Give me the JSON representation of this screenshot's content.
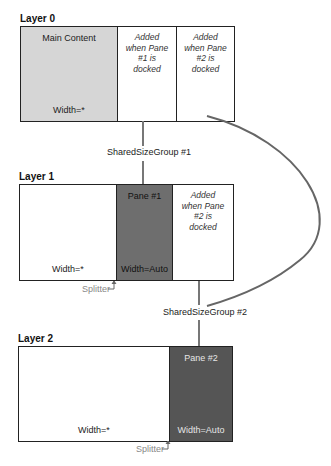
{
  "layers": [
    {
      "title": "Layer 0",
      "columns": [
        {
          "top": "Main Content",
          "bottom": "Width=*",
          "style": "gray"
        },
        {
          "top": "Added when Pane #1 is docked",
          "bottom": "",
          "style": "white-italic"
        },
        {
          "top": "Added when Pane #2 is docked",
          "bottom": "",
          "style": "white-italic"
        }
      ]
    },
    {
      "title": "Layer 1",
      "columns": [
        {
          "top": "",
          "bottom": "Width=*",
          "style": "white"
        },
        {
          "top": "Pane #1",
          "bottom": "Width=Auto",
          "style": "dark"
        },
        {
          "top": "Added when Pane #2 is docked",
          "bottom": "",
          "style": "white-italic"
        }
      ],
      "splitter": "Splitter"
    },
    {
      "title": "Layer 2",
      "columns": [
        {
          "top": "",
          "bottom": "Width=*",
          "style": "white"
        },
        {
          "top": "Pane #2",
          "bottom": "Width=Auto",
          "style": "darker"
        }
      ],
      "splitter": "Splitter"
    }
  ],
  "connectors": {
    "group1": "SharedSizeGroup #1",
    "group2": "SharedSizeGroup #2"
  },
  "colors": {
    "main_content_fill": "#d6d6d6",
    "pane1_fill": "#6e6e6e",
    "pane2_fill": "#555555",
    "connector": "#777777",
    "splitter_text": "#888888"
  }
}
